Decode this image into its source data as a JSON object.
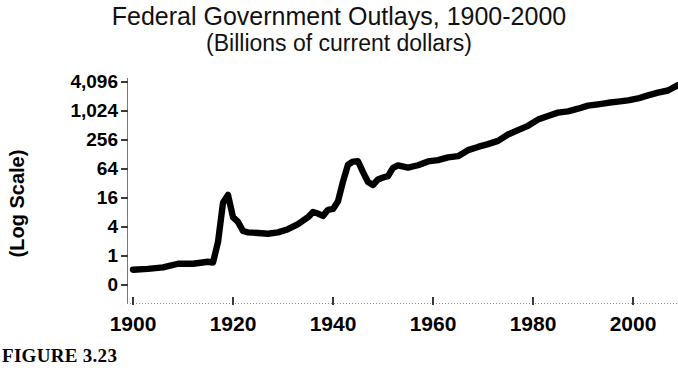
{
  "figure": {
    "caption": "FIGURE 3.23"
  },
  "chart_data": {
    "type": "line",
    "title": "Federal Government Outlays, 1900-2000",
    "subtitle": "(Billions of current dollars)",
    "xlabel": "",
    "ylabel": "(Log Scale)",
    "grid": false,
    "legend": "none",
    "xlim": [
      1900,
      2009
    ],
    "ylim": [
      0,
      4096
    ],
    "yscale": "log",
    "xticks": [
      1900,
      1920,
      1940,
      1960,
      1980,
      2000
    ],
    "xtick_labels": [
      "1900",
      "1920",
      "1940",
      "1960",
      "1980",
      "2000"
    ],
    "yticks": [
      0,
      1,
      4,
      16,
      64,
      256,
      1024,
      4096
    ],
    "ytick_labels": [
      "0",
      "1",
      "4",
      "16",
      "64",
      "256",
      "1,024",
      "4,096"
    ],
    "series": [
      {
        "name": "Federal Government Outlays",
        "color": "#000000",
        "x": [
          1900,
          1903,
          1906,
          1909,
          1912,
          1915,
          1916,
          1917,
          1918,
          1919,
          1920,
          1921,
          1922,
          1923,
          1925,
          1927,
          1929,
          1931,
          1933,
          1935,
          1936,
          1937,
          1938,
          1939,
          1940,
          1941,
          1942,
          1943,
          1944,
          1945,
          1946,
          1947,
          1948,
          1949,
          1950,
          1951,
          1952,
          1953,
          1955,
          1957,
          1959,
          1961,
          1963,
          1965,
          1967,
          1969,
          1971,
          1973,
          1975,
          1977,
          1979,
          1981,
          1983,
          1985,
          1987,
          1989,
          1991,
          1993,
          1995,
          1997,
          1999,
          2001,
          2003,
          2005,
          2007,
          2009
        ],
        "values": [
          0.52,
          0.54,
          0.58,
          0.69,
          0.69,
          0.76,
          0.73,
          1.95,
          12.7,
          18.5,
          6.4,
          5.1,
          3.3,
          3.1,
          3.0,
          2.9,
          3.1,
          3.6,
          4.6,
          6.4,
          8.2,
          7.6,
          6.8,
          9.1,
          9.5,
          13.7,
          35.1,
          78.6,
          91.3,
          92.7,
          55.2,
          34.5,
          29.8,
          38.8,
          42.6,
          45.5,
          67.7,
          76.1,
          68.4,
          76.6,
          92.1,
          97.7,
          111.3,
          118.2,
          157.5,
          183.6,
          210.2,
          245.7,
          332.3,
          409.2,
          504.0,
          678.2,
          808.4,
          946.3,
          1004.0,
          1143.7,
          1324.2,
          1409.4,
          1515.7,
          1601.1,
          1701.8,
          1862.8,
          2159.9,
          2472.0,
          2728.7,
          3517.7
        ]
      }
    ],
    "annotations": []
  }
}
